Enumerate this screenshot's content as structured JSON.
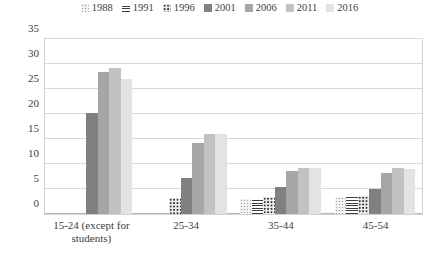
{
  "chart_data": {
    "type": "bar",
    "title": "",
    "subtitle": "",
    "xlabel": "",
    "ylabel": "",
    "ylim": [
      0,
      35
    ],
    "yticks": [
      0,
      5,
      10,
      15,
      20,
      25,
      30,
      35
    ],
    "grid": "horizontal",
    "legend_position": "top",
    "categories": [
      "15-24 (except for students)",
      "25-34",
      "35-44",
      "45-54"
    ],
    "series": [
      {
        "name": "1988",
        "color": "#f2f2f2",
        "pattern": "light-dots",
        "values": [
          null,
          0,
          3.1,
          3.5
        ]
      },
      {
        "name": "1991",
        "color": "#ffffff",
        "pattern": "horizontal-lines",
        "values": [
          null,
          0,
          3.3,
          3.5
        ]
      },
      {
        "name": "1996",
        "color": "#ededed",
        "pattern": "dense-dots",
        "values": [
          null,
          3.3,
          3.4,
          3.6
        ]
      },
      {
        "name": "2001",
        "color": "#808080",
        "pattern": "solid",
        "values": [
          20.3,
          7.2,
          5.5,
          5.0
        ]
      },
      {
        "name": "2006",
        "color": "#a6a6a6",
        "pattern": "solid",
        "values": [
          28.5,
          14.2,
          8.6,
          8.3
        ]
      },
      {
        "name": "2011",
        "color": "#c2c2c2",
        "pattern": "solid",
        "values": [
          29.3,
          16.0,
          9.2,
          9.2
        ]
      },
      {
        "name": "2016",
        "color": "#e3e3e3",
        "pattern": "solid",
        "values": [
          27.1,
          16.0,
          9.2,
          9.1
        ]
      }
    ]
  }
}
